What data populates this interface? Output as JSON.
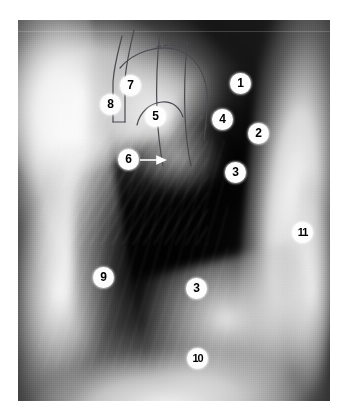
{
  "figure": {
    "kind": "lateral-chest-radiograph",
    "background_color": "#ffffff",
    "plate_color": "#141414",
    "marker_fill": "#fdfdfd",
    "marker_text_color": "#000000",
    "plate": {
      "left": 18,
      "top": 20,
      "width": 312,
      "height": 381
    }
  },
  "markers": [
    {
      "label": "1",
      "x": 240,
      "y": 83,
      "name": "marker-1"
    },
    {
      "label": "2",
      "x": 258,
      "y": 133,
      "name": "marker-2"
    },
    {
      "label": "3",
      "x": 235,
      "y": 172,
      "name": "marker-3a"
    },
    {
      "label": "4",
      "x": 222,
      "y": 119,
      "name": "marker-4"
    },
    {
      "label": "5",
      "x": 155,
      "y": 116,
      "name": "marker-5"
    },
    {
      "label": "6",
      "x": 128,
      "y": 159,
      "name": "marker-6"
    },
    {
      "label": "7",
      "x": 130,
      "y": 85,
      "name": "marker-7"
    },
    {
      "label": "8",
      "x": 110,
      "y": 104,
      "name": "marker-8"
    },
    {
      "label": "9",
      "x": 103,
      "y": 277,
      "name": "marker-9"
    },
    {
      "label": "3",
      "x": 196,
      "y": 288,
      "name": "marker-3b"
    },
    {
      "label": "10",
      "x": 197,
      "y": 358,
      "name": "marker-10"
    },
    {
      "label": "11",
      "x": 302,
      "y": 232,
      "name": "marker-11"
    }
  ],
  "leader": {
    "name": "marker-6-arrow",
    "from_x": 140,
    "from_y": 160,
    "to_x": 163,
    "to_y": 160
  }
}
